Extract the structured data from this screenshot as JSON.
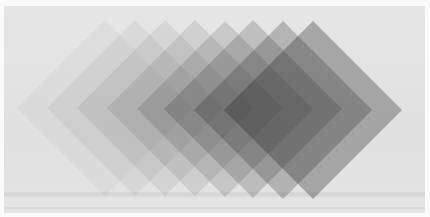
{
  "image": {
    "description": "Photograph of overlapping translucent gray diamond (rotated square) filters stepping from light on the left to dark on the right",
    "background_color": "#e2e2e2",
    "diamond_color": "#2a2a2a",
    "diamonds": [
      {
        "cx": 105,
        "cy": 108,
        "half": 88,
        "opacity": 0.04
      },
      {
        "cx": 135,
        "cy": 108,
        "half": 88,
        "opacity": 0.06
      },
      {
        "cx": 165,
        "cy": 108,
        "half": 88,
        "opacity": 0.08
      },
      {
        "cx": 195,
        "cy": 108,
        "half": 88,
        "opacity": 0.11
      },
      {
        "cx": 225,
        "cy": 109,
        "half": 88,
        "opacity": 0.15
      },
      {
        "cx": 253,
        "cy": 109,
        "half": 89,
        "opacity": 0.2
      },
      {
        "cx": 283,
        "cy": 110,
        "half": 89,
        "opacity": 0.26
      },
      {
        "cx": 313,
        "cy": 110,
        "half": 89,
        "opacity": 0.33
      }
    ]
  }
}
